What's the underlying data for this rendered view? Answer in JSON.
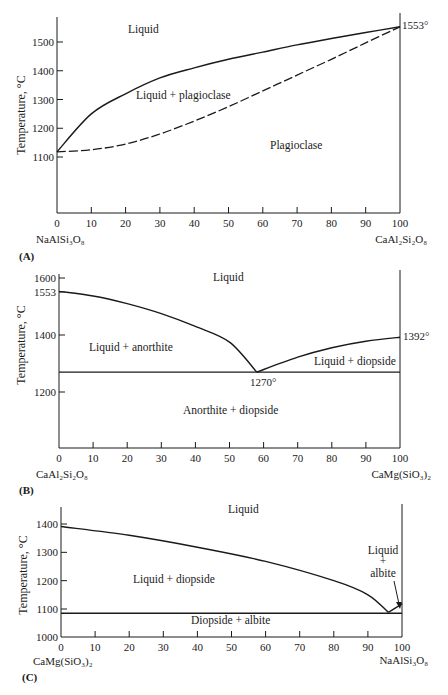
{
  "figure": {
    "panels": [
      {
        "tag": "(A)",
        "ylabel": "Temperature, °C",
        "left_compound": "NaAlSi₃O₈",
        "right_compound": "CaAl₂Si₂O₈",
        "regions": [
          "Liquid",
          "Liquid + plagioclase",
          "Plagioclase"
        ],
        "annotations": [
          "1553°"
        ]
      },
      {
        "tag": "(B)",
        "ylabel": "Temperature, °C",
        "left_compound": "CaAl₂Si₂O₈",
        "right_compound": "CaMg(SiO₃)₂",
        "regions": [
          "Liquid",
          "Liquid + anorthite",
          "Liquid + diopside",
          "Anorthite + diopside"
        ],
        "annotations": [
          "1392°",
          "1270°"
        ]
      },
      {
        "tag": "(C)",
        "ylabel": "Temperature, °C",
        "left_compound": "CaMg(SiO₃)₂",
        "right_compound": "NaAlSi₃O₈",
        "regions": [
          "Liquid",
          "Liquid + diopside",
          "Diopside + albite"
        ],
        "liquid_albite": [
          "Liquid",
          "+",
          "albite"
        ]
      }
    ]
  },
  "chart_data": [
    {
      "type": "line",
      "title": "(A) NaAlSi3O8 – CaAl2Si2O8 (plagioclase solid solution)",
      "xlabel": "wt% CaAl2Si2O8 (NaAlSi3O8 → CaAl2Si2O8)",
      "ylabel": "Temperature, °C",
      "x_ticks": [
        0,
        10,
        20,
        30,
        40,
        50,
        60,
        70,
        80,
        90,
        100
      ],
      "y_ticks": [
        1100,
        1200,
        1300,
        1400,
        1500
      ],
      "xlim": [
        0,
        100
      ],
      "ylim": [
        900,
        1600
      ],
      "grid": false,
      "series": [
        {
          "name": "Liquidus",
          "style": "solid",
          "x": [
            0,
            10,
            20,
            30,
            40,
            50,
            60,
            70,
            80,
            90,
            100
          ],
          "y": [
            1118,
            1250,
            1320,
            1375,
            1410,
            1440,
            1465,
            1490,
            1512,
            1533,
            1553
          ]
        },
        {
          "name": "Solidus",
          "style": "dashed",
          "x": [
            0,
            10,
            20,
            30,
            40,
            50,
            60,
            70,
            80,
            90,
            100
          ],
          "y": [
            1118,
            1125,
            1145,
            1180,
            1225,
            1275,
            1330,
            1385,
            1440,
            1497,
            1553
          ]
        }
      ],
      "annotations": [
        {
          "text": "1553°",
          "x": 100,
          "y": 1553
        }
      ],
      "regions": [
        "Liquid",
        "Liquid + plagioclase",
        "Plagioclase"
      ]
    },
    {
      "type": "line",
      "title": "(B) CaAl2Si2O8 – CaMg(SiO3)2 (binary eutectic)",
      "xlabel": "wt% CaMg(SiO3)2 (CaAl2Si2O8 → CaMg(SiO3)2)",
      "ylabel": "Temperature, °C",
      "x_ticks": [
        0,
        10,
        20,
        30,
        40,
        50,
        60,
        70,
        80,
        90,
        100
      ],
      "y_ticks": [
        1200,
        1400,
        1553,
        1600
      ],
      "xlim": [
        0,
        100
      ],
      "ylim": [
        1000,
        1650
      ],
      "grid": false,
      "series": [
        {
          "name": "Liquidus (anorthite)",
          "style": "solid",
          "x": [
            0,
            10,
            20,
            30,
            40,
            50,
            58
          ],
          "y": [
            1553,
            1537,
            1510,
            1475,
            1430,
            1375,
            1270
          ]
        },
        {
          "name": "Liquidus (diopside)",
          "style": "solid",
          "x": [
            58,
            70,
            80,
            90,
            100
          ],
          "y": [
            1270,
            1322,
            1355,
            1378,
            1392
          ]
        },
        {
          "name": "Eutectic isotherm",
          "style": "solid",
          "x": [
            0,
            100
          ],
          "y": [
            1270,
            1270
          ]
        }
      ],
      "annotations": [
        {
          "text": "1392°",
          "x": 100,
          "y": 1392
        },
        {
          "text": "1270°",
          "x": 58,
          "y": 1270
        }
      ],
      "regions": [
        "Liquid",
        "Liquid + anorthite",
        "Liquid + diopside",
        "Anorthite + diopside"
      ]
    },
    {
      "type": "line",
      "title": "(C) CaMg(SiO3)2 – NaAlSi3O8 (binary eutectic)",
      "xlabel": "wt% NaAlSi3O8 (CaMg(SiO3)2 → NaAlSi3O8)",
      "ylabel": "Temperature, °C",
      "x_ticks": [
        0,
        10,
        20,
        30,
        40,
        50,
        60,
        70,
        80,
        90,
        100
      ],
      "y_ticks": [
        1000,
        1100,
        1200,
        1300,
        1400
      ],
      "xlim": [
        0,
        100
      ],
      "ylim": [
        1000,
        1450
      ],
      "grid": false,
      "series": [
        {
          "name": "Liquidus (diopside)",
          "style": "solid",
          "x": [
            0,
            20,
            40,
            60,
            80,
            90,
            96
          ],
          "y": [
            1391,
            1360,
            1318,
            1268,
            1200,
            1150,
            1088
          ]
        },
        {
          "name": "Liquidus (albite)",
          "style": "solid",
          "x": [
            96,
            100
          ],
          "y": [
            1088,
            1118
          ]
        },
        {
          "name": "Eutectic isotherm",
          "style": "solid",
          "x": [
            0,
            100
          ],
          "y": [
            1085,
            1085
          ]
        }
      ],
      "regions": [
        "Liquid",
        "Liquid + diopside",
        "Liquid + albite",
        "Diopside + albite"
      ]
    }
  ]
}
